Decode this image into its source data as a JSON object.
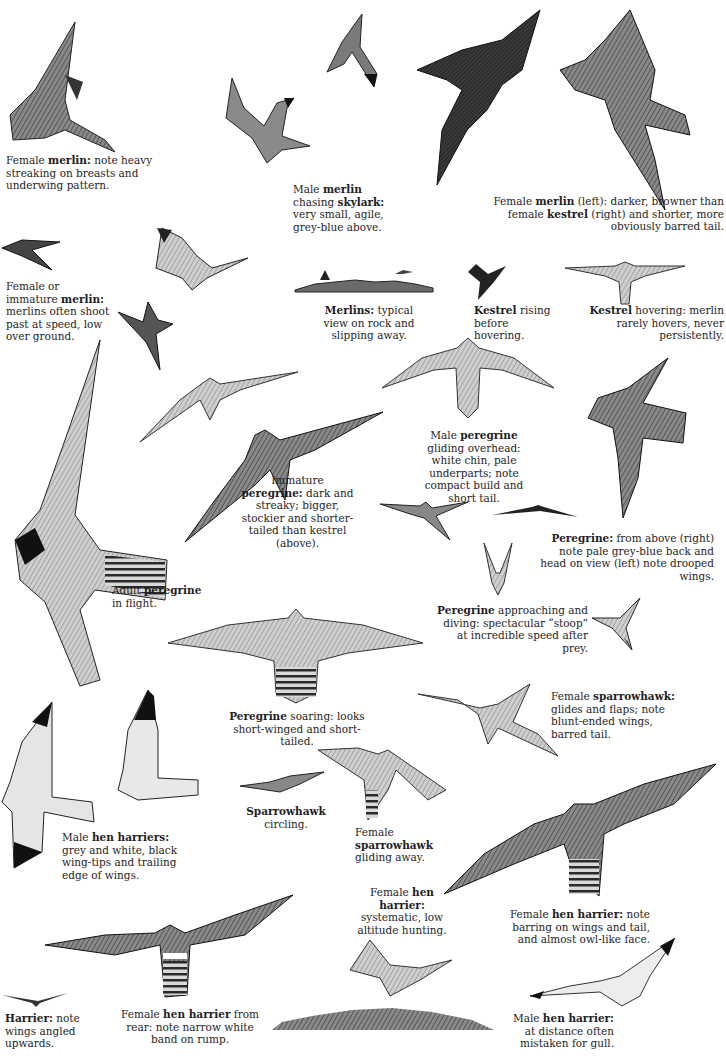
{
  "page": {
    "topic": "Falcons, sparrowhawk and hen harrier in flight",
    "colors": {
      "ink": "#1e1e1e",
      "paper": "#ffffff",
      "feather_dark": "#2a2a2a",
      "feather_mid": "#6b6b6b",
      "feather_light": "#bdbdbd"
    }
  },
  "captions": [
    {
      "id": "c1",
      "parts": [
        {
          "t": "Female "
        },
        {
          "t": "merlin:",
          "b": true
        },
        {
          "t": " note heavy streaking on breasts and underwing pattern."
        }
      ]
    },
    {
      "id": "c2",
      "parts": [
        {
          "t": "Male "
        },
        {
          "t": "merlin",
          "b": true
        },
        {
          "t": " chasing "
        },
        {
          "t": "skylark:",
          "b": true
        },
        {
          "t": " very small, agile, grey-blue above."
        }
      ]
    },
    {
      "id": "c3",
      "parts": [
        {
          "t": "Female "
        },
        {
          "t": "merlin",
          "b": true
        },
        {
          "t": " (left): darker, browner than female "
        },
        {
          "t": "kestrel",
          "b": true
        },
        {
          "t": " (right) and shorter, more obviously barred tail."
        }
      ]
    },
    {
      "id": "c4",
      "parts": [
        {
          "t": "Female or immature "
        },
        {
          "t": "merlin:",
          "b": true
        },
        {
          "t": " merlins often shoot past at speed, low over ground."
        }
      ]
    },
    {
      "id": "c5",
      "parts": [
        {
          "t": "Merlins:",
          "b": true
        },
        {
          "t": " typical view on rock and slipping away."
        }
      ]
    },
    {
      "id": "c6",
      "parts": [
        {
          "t": "Kestrel",
          "b": true
        },
        {
          "t": " rising before hovering."
        }
      ]
    },
    {
      "id": "c7",
      "parts": [
        {
          "t": "Kestrel",
          "b": true
        },
        {
          "t": " hovering: merlin rarely hovers, never persistently."
        }
      ]
    },
    {
      "id": "c8",
      "parts": [
        {
          "t": "Male "
        },
        {
          "t": "peregrine",
          "b": true
        },
        {
          "t": " gliding overhead: white chin, pale underparts; note compact build and short tail."
        }
      ]
    },
    {
      "id": "c9",
      "parts": [
        {
          "t": "Immature "
        },
        {
          "t": "peregrine:",
          "b": true
        },
        {
          "t": " dark and streaky; bigger, stockier and shorter-tailed than kestrel (above)."
        }
      ]
    },
    {
      "id": "c10",
      "parts": [
        {
          "t": "Peregrine:",
          "b": true
        },
        {
          "t": " from above (right) note pale grey-blue back and head on view (left) note drooped wings."
        }
      ]
    },
    {
      "id": "c11",
      "parts": [
        {
          "t": "Adult "
        },
        {
          "t": "peregrine",
          "b": true
        },
        {
          "t": " in flight."
        }
      ]
    },
    {
      "id": "c12",
      "parts": [
        {
          "t": "Peregrine",
          "b": true
        },
        {
          "t": " approaching and diving: spectacular “stoop” at incredible speed after prey."
        }
      ]
    },
    {
      "id": "c13",
      "parts": [
        {
          "t": "Peregrine",
          "b": true
        },
        {
          "t": " soaring: looks short-winged and short-tailed."
        }
      ]
    },
    {
      "id": "c14",
      "parts": [
        {
          "t": "Female "
        },
        {
          "t": "sparrowhawk:",
          "b": true
        },
        {
          "t": " glides and flaps; note blunt-ended wings, barred tail."
        }
      ]
    },
    {
      "id": "c15",
      "parts": [
        {
          "t": "Male "
        },
        {
          "t": "hen harriers:",
          "b": true
        },
        {
          "t": " grey and white, black wing-tips and trailing edge of wings."
        }
      ]
    },
    {
      "id": "c16",
      "parts": [
        {
          "t": "Sparrowhawk",
          "b": true
        },
        {
          "t": " circling."
        }
      ]
    },
    {
      "id": "c17",
      "parts": [
        {
          "t": "Female "
        },
        {
          "t": "sparrowhawk",
          "b": true
        },
        {
          "t": " gliding away."
        }
      ]
    },
    {
      "id": "c18",
      "parts": [
        {
          "t": "Female "
        },
        {
          "t": "hen harrier:",
          "b": true
        },
        {
          "t": " systematic, low altitude hunting."
        }
      ]
    },
    {
      "id": "c19",
      "parts": [
        {
          "t": "Female "
        },
        {
          "t": "hen harrier:",
          "b": true
        },
        {
          "t": " note barring on wings and tail, and almost owl-like face."
        }
      ]
    },
    {
      "id": "c20",
      "parts": [
        {
          "t": "Harrier:",
          "b": true
        },
        {
          "t": " note wings angled upwards."
        }
      ]
    },
    {
      "id": "c21",
      "parts": [
        {
          "t": "Female "
        },
        {
          "t": "hen harrier",
          "b": true
        },
        {
          "t": " from rear: note narrow white band on rump."
        }
      ]
    },
    {
      "id": "c22",
      "parts": [
        {
          "t": "Male "
        },
        {
          "t": "hen harrier:",
          "b": true
        },
        {
          "t": " at distance often mistaken for gull."
        }
      ]
    }
  ],
  "illustrations": [
    "female-merlin-underside",
    "male-merlin",
    "skylark",
    "female-merlin-dark",
    "female-kestrel",
    "merlin-low-over-ground",
    "merlin-banking",
    "merlin-twisting",
    "merlin-on-rock",
    "merlin-slipping-away",
    "kestrel-rising",
    "kestrel-hovering",
    "adult-peregrine",
    "kestrel-gliding",
    "immature-peregrine",
    "male-peregrine-gliding",
    "peregrine-from-above",
    "peregrine-head-on",
    "peregrine-distant",
    "peregrine-stoop-front",
    "peregrine-stoop-side",
    "peregrine-soaring",
    "female-sparrowhawk-flapping",
    "male-hen-harrier-1",
    "male-hen-harrier-2",
    "sparrowhawk-circling",
    "female-sparrowhawk-gliding-away",
    "female-hen-harrier-spread",
    "female-hen-harrier-hunting",
    "female-hen-harrier-rear",
    "harrier-distant",
    "moorland-ground",
    "male-hen-harrier-distant"
  ]
}
